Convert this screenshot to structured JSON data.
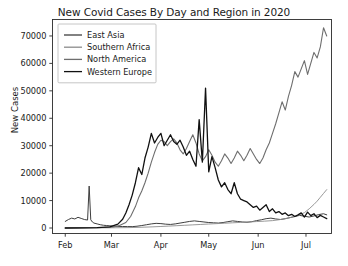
{
  "chart_data": {
    "type": "line",
    "title": "New Covid Cases By Day and Region in 2020",
    "xlabel": "",
    "ylabel": "New Cases",
    "grid": false,
    "legend_position": "upper left",
    "ylim": [
      -2000,
      76000
    ],
    "yticks": [
      0,
      10000,
      20000,
      30000,
      40000,
      50000,
      60000,
      70000
    ],
    "ytick_labels": [
      "0",
      "10000",
      "20000",
      "30000",
      "40000",
      "50000",
      "60000",
      "70000"
    ],
    "xticks": [
      0,
      29,
      60,
      90,
      121,
      151
    ],
    "xtick_labels": [
      "Feb",
      "Mar",
      "Apr",
      "May",
      "Jun",
      "Jul"
    ],
    "xlim": [
      -8,
      167
    ],
    "x_unit": "days since Feb 1 2020",
    "series": [
      {
        "name": "East Asia",
        "color": "#3f3f3f",
        "linewidth": 1.0,
        "x": [
          0,
          2,
          4,
          6,
          8,
          10,
          12,
          14,
          15,
          16,
          17,
          18,
          20,
          22,
          24,
          26,
          28,
          30,
          33,
          36,
          39,
          42,
          45,
          48,
          51,
          54,
          57,
          60,
          63,
          66,
          69,
          72,
          75,
          78,
          81,
          84,
          87,
          90,
          93,
          96,
          99,
          102,
          105,
          108,
          111,
          114,
          117,
          120,
          123,
          126,
          129,
          132,
          135,
          138,
          141,
          144,
          147,
          150,
          153,
          156,
          159,
          162,
          164
        ],
        "values": [
          2400,
          3100,
          3600,
          3300,
          3900,
          3500,
          3100,
          2900,
          15300,
          3000,
          2200,
          1800,
          1500,
          1200,
          1000,
          900,
          800,
          700,
          600,
          550,
          520,
          500,
          650,
          900,
          1200,
          1500,
          1700,
          1600,
          1400,
          1300,
          1500,
          1800,
          2100,
          2400,
          2600,
          2400,
          2200,
          2000,
          1900,
          1800,
          2000,
          2300,
          2600,
          2400,
          2200,
          2100,
          2300,
          2700,
          3000,
          3400,
          3600,
          3300,
          3100,
          3400,
          3800,
          4200,
          4600,
          4300,
          4000,
          4400,
          4900,
          5200,
          4800
        ]
      },
      {
        "name": "Southern Africa",
        "color": "#8c8c8c",
        "linewidth": 0.9,
        "x": [
          0,
          10,
          20,
          30,
          40,
          45,
          50,
          55,
          60,
          65,
          70,
          75,
          80,
          85,
          90,
          95,
          100,
          105,
          110,
          115,
          120,
          125,
          130,
          134,
          138,
          142,
          146,
          150,
          153,
          156,
          158,
          160,
          162,
          164
        ],
        "values": [
          30,
          40,
          60,
          90,
          150,
          230,
          320,
          430,
          560,
          700,
          850,
          1000,
          1150,
          1300,
          1450,
          1600,
          1750,
          1900,
          2050,
          2200,
          2350,
          2500,
          2700,
          3000,
          3400,
          3900,
          4600,
          5600,
          7000,
          8600,
          9800,
          11200,
          12600,
          14000
        ]
      },
      {
        "name": "North America",
        "color": "#6e6e6e",
        "linewidth": 1.1,
        "x": [
          0,
          8,
          16,
          24,
          30,
          34,
          38,
          41,
          44,
          46,
          48,
          50,
          52,
          54,
          56,
          58,
          60,
          62,
          64,
          66,
          68,
          70,
          72,
          74,
          76,
          78,
          80,
          82,
          84,
          86,
          88,
          90,
          92,
          94,
          96,
          98,
          100,
          102,
          104,
          106,
          108,
          110,
          112,
          114,
          116,
          118,
          120,
          122,
          124,
          126,
          128,
          130,
          132,
          134,
          136,
          138,
          140,
          142,
          144,
          146,
          148,
          150,
          152,
          154,
          156,
          158,
          160,
          162,
          164
        ],
        "values": [
          20,
          40,
          80,
          160,
          400,
          900,
          2000,
          4200,
          7800,
          11000,
          13500,
          16500,
          20000,
          24000,
          27500,
          30500,
          32000,
          31500,
          30000,
          31500,
          32500,
          31000,
          28500,
          27000,
          29000,
          31500,
          34000,
          31000,
          27000,
          24500,
          26000,
          28500,
          26500,
          24000,
          22500,
          24500,
          27000,
          25500,
          23500,
          25500,
          28000,
          26500,
          24500,
          26500,
          29000,
          27000,
          25000,
          23500,
          25500,
          28500,
          31000,
          34500,
          38000,
          42000,
          46000,
          43000,
          48000,
          52000,
          57000,
          55000,
          58000,
          61000,
          56000,
          60000,
          64000,
          62000,
          66000,
          73000,
          70000
        ]
      },
      {
        "name": "Western Europe",
        "color": "#111111",
        "linewidth": 1.3,
        "x": [
          0,
          10,
          20,
          28,
          33,
          36,
          38,
          40,
          42,
          44,
          46,
          48,
          50,
          52,
          54,
          56,
          58,
          60,
          62,
          64,
          66,
          68,
          70,
          72,
          74,
          76,
          78,
          80,
          82,
          84,
          86,
          88,
          90,
          92,
          94,
          96,
          98,
          100,
          102,
          104,
          106,
          108,
          110,
          112,
          114,
          116,
          118,
          120,
          122,
          124,
          126,
          128,
          130,
          132,
          134,
          136,
          138,
          140,
          142,
          144,
          146,
          148,
          150,
          152,
          154,
          156,
          158,
          160,
          162,
          164
        ],
        "values": [
          10,
          30,
          120,
          450,
          1400,
          3200,
          5500,
          8500,
          12000,
          16500,
          22000,
          19500,
          25500,
          29500,
          34500,
          31000,
          33000,
          34500,
          30000,
          32000,
          34000,
          31500,
          30500,
          32000,
          29500,
          26500,
          28000,
          25000,
          22500,
          39500,
          24000,
          51000,
          20500,
          26000,
          22000,
          17500,
          15000,
          16500,
          14000,
          12500,
          16500,
          12500,
          10500,
          10000,
          9500,
          8500,
          7500,
          8000,
          6500,
          7500,
          8500,
          6000,
          7000,
          5500,
          6000,
          5000,
          5500,
          4500,
          5000,
          4200,
          4800,
          5500,
          4000,
          5800,
          4500,
          5200,
          3800,
          4600,
          4000,
          3400
        ]
      }
    ]
  }
}
